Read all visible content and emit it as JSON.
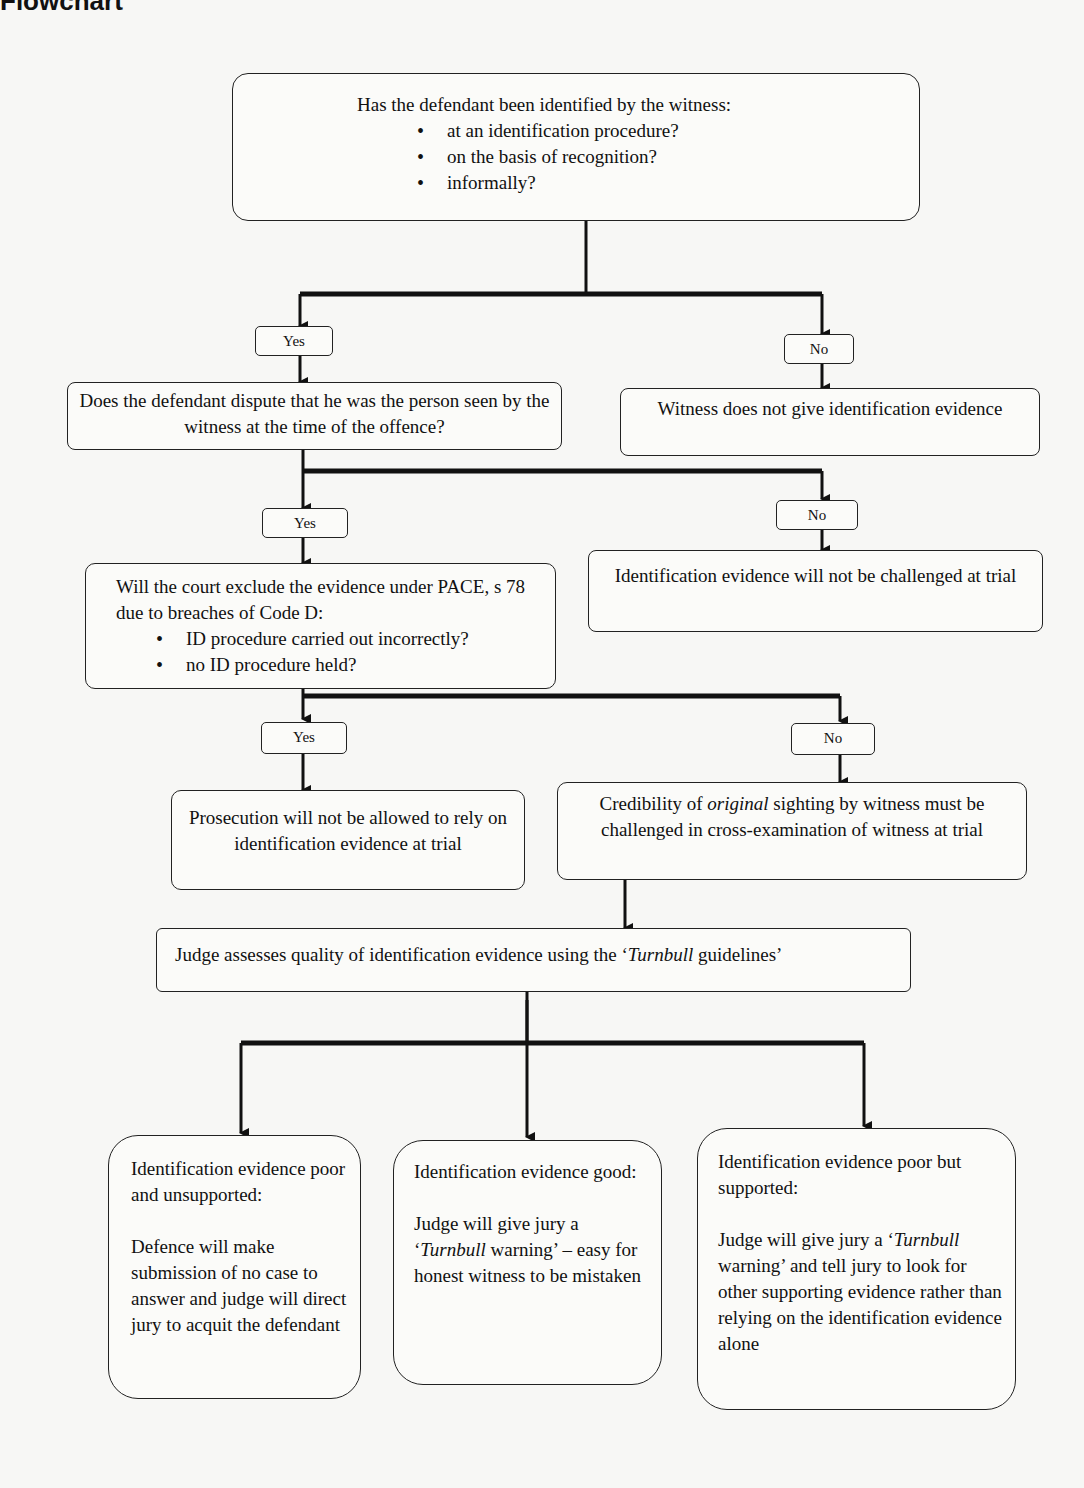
{
  "header": {
    "title": "Flowchart"
  },
  "nodes": {
    "q1": {
      "title": "Has the defendant been identified by the witness:",
      "bullets": [
        "at an identification procedure?",
        "on the basis of recognition?",
        "informally?"
      ]
    },
    "q1_yes": "Yes",
    "q1_no": "No",
    "q2": {
      "text": "Does the defendant dispute that he was the person seen by the witness at the time of the offence?"
    },
    "q1_no_result": {
      "text": "Witness does not give identification evidence"
    },
    "q2_yes": "Yes",
    "q2_no": "No",
    "q3": {
      "title": "Will the court exclude the evidence under PACE, s 78 due to breaches of Code D:",
      "bullets": [
        "ID procedure carried out incorrectly?",
        "no ID procedure held?"
      ]
    },
    "q2_no_result": {
      "text": "Identification evidence will not be challenged at trial"
    },
    "q3_yes": "Yes",
    "q3_no": "No",
    "q3_yes_result": {
      "text": "Prosecution will not be allowed to rely on identification evidence at trial"
    },
    "q3_no_result": {
      "pre": "Credibility of ",
      "em": "original",
      "post": " sighting by witness must be challenged in cross-examination of witness at trial"
    },
    "judge": {
      "pre": "Judge assesses quality of identification evidence using the ‘",
      "em": "Turnbull",
      "post": " guidelines’"
    },
    "outcome_poor_unsupported": {
      "heading": "Identification evidence poor and unsupported:",
      "body": "Defence will make submission of no case to answer and judge will direct jury to acquit the defendant"
    },
    "outcome_good": {
      "heading": "Identification evidence good:",
      "body_pre": "Judge will give jury a ‘",
      "body_em": "Turnbull",
      "body_post": " warning’ – easy for honest witness to be mistaken"
    },
    "outcome_poor_supported": {
      "heading": "Identification evidence poor but supported:",
      "body_pre": "Judge will give jury a ‘",
      "body_em": "Turnbull",
      "body_post": " warning’ and tell jury to look for other supporting evidence rather than relying on the identification evidence alone"
    }
  }
}
